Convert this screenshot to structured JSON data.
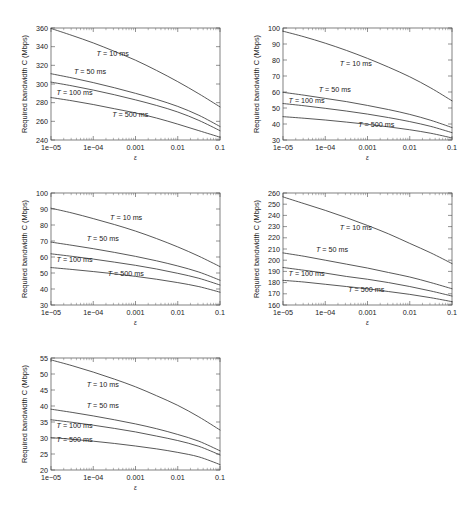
{
  "figure": {
    "background": "#ffffff",
    "axis_color": "#4a4a4a",
    "curve_color": "#3a3a3a",
    "panel_count": 5,
    "layout": "2 columns x 3 rows, last row single panel at left"
  },
  "common": {
    "xlabel": "ε",
    "ylabel": "Required bandwidth C (Mbps)",
    "xticklabels": [
      "1e−05",
      "1e−04",
      "0.001",
      "0.01",
      "0.1"
    ],
    "xticks": [
      1e-05,
      0.0001,
      0.001,
      0.01,
      0.1
    ],
    "xscale": "log",
    "xlim": [
      1e-05,
      0.1
    ],
    "series_names": [
      "T = 10 ms",
      "T = 50 ms",
      "T = 100 ms",
      "T = 500 ms"
    ]
  },
  "chart_data": [
    {
      "id": "panel-1",
      "position": "top-left",
      "type": "line",
      "title": "",
      "xlabel": "ε",
      "ylabel": "Required bandwidth C (Mbps)",
      "xscale": "log",
      "xlim": [
        1e-05,
        0.1
      ],
      "ylim": [
        240,
        360
      ],
      "yticks": [
        240,
        260,
        280,
        300,
        320,
        340,
        360
      ],
      "yticklabels": [
        "240",
        "260",
        "280",
        "300",
        "320",
        "340",
        "360"
      ],
      "xticklabels": [
        "1e−05",
        "1e−04",
        "0.001",
        "0.01",
        "0.1"
      ],
      "grid": false,
      "legend": "inline curve annotations",
      "x": [
        1e-05,
        3.16e-05,
        0.0001,
        0.000316,
        0.001,
        0.00316,
        0.01,
        0.0316,
        0.1
      ],
      "series": [
        {
          "name": "T = 10 ms",
          "label": "T = 10 ms",
          "values": [
            359.5,
            352.0,
            344.0,
            335.0,
            325.5,
            314.5,
            302.5,
            289.5,
            275.5
          ],
          "label_pos": {
            "x": 0.00012,
            "y": 330
          }
        },
        {
          "name": "T = 50 ms",
          "label": "T = 50 ms",
          "values": [
            311.0,
            306.5,
            301.5,
            296.0,
            290.0,
            283.5,
            276.0,
            266.5,
            254.5
          ],
          "label_pos": {
            "x": 3.5e-05,
            "y": 311
          }
        },
        {
          "name": "T = 100 ms",
          "label": "T = 100 ms",
          "values": [
            302.0,
            298.0,
            293.5,
            288.5,
            283.0,
            277.0,
            270.0,
            261.0,
            250.0
          ],
          "label_pos": {
            "x": 1.35e-05,
            "y": 288
          }
        },
        {
          "name": "T = 500 ms",
          "label": "T = 500 ms",
          "values": [
            285.5,
            282.0,
            278.0,
            273.5,
            269.0,
            263.5,
            257.0,
            250.0,
            243.0
          ],
          "label_pos": {
            "x": 0.00028,
            "y": 265
          }
        }
      ]
    },
    {
      "id": "panel-2",
      "position": "top-right",
      "type": "line",
      "title": "",
      "xlabel": "ε",
      "ylabel": "Required bandwidth C (Mbps)",
      "xscale": "log",
      "xlim": [
        1e-05,
        0.1
      ],
      "ylim": [
        30,
        100
      ],
      "yticks": [
        30,
        40,
        50,
        60,
        70,
        80,
        90,
        100
      ],
      "yticklabels": [
        "30",
        "40",
        "50",
        "60",
        "70",
        "80",
        "90",
        "100"
      ],
      "xticklabels": [
        "1e−05",
        "1e−04",
        "0.001",
        "0.01",
        "0.1"
      ],
      "grid": false,
      "legend": "inline curve annotations",
      "x": [
        1e-05,
        3.16e-05,
        0.0001,
        0.000316,
        0.001,
        0.00316,
        0.01,
        0.0316,
        0.1
      ],
      "series": [
        {
          "name": "T = 10 ms",
          "label": "T = 10 ms",
          "values": [
            98.0,
            94.5,
            90.5,
            86.0,
            81.0,
            75.5,
            69.5,
            62.5,
            54.5
          ],
          "label_pos": {
            "x": 0.00022,
            "y": 76
          }
        },
        {
          "name": "T = 50 ms",
          "label": "T = 50 ms",
          "values": [
            59.8,
            58.0,
            56.0,
            54.0,
            51.6,
            49.0,
            46.0,
            42.3,
            37.8
          ],
          "label_pos": {
            "x": 7e-05,
            "y": 60
          }
        },
        {
          "name": "T = 100 ms",
          "label": "T = 100 ms",
          "values": [
            52.8,
            51.4,
            49.8,
            48.1,
            46.2,
            44.0,
            41.5,
            38.5,
            34.6
          ],
          "label_pos": {
            "x": 1.35e-05,
            "y": 53
          }
        },
        {
          "name": "T = 500 ms",
          "label": "T = 500 ms",
          "values": [
            44.6,
            43.6,
            42.5,
            41.2,
            39.8,
            38.2,
            36.4,
            34.2,
            31.3
          ],
          "label_pos": {
            "x": 0.0006,
            "y": 38
          }
        }
      ]
    },
    {
      "id": "panel-3",
      "position": "middle-left",
      "type": "line",
      "title": "",
      "xlabel": "ε",
      "ylabel": "Required bandwidth C (Mbps)",
      "xscale": "log",
      "xlim": [
        1e-05,
        0.1
      ],
      "ylim": [
        30,
        100
      ],
      "yticks": [
        30,
        40,
        50,
        60,
        70,
        80,
        90,
        100
      ],
      "yticklabels": [
        "30",
        "40",
        "50",
        "60",
        "70",
        "80",
        "90",
        "100"
      ],
      "xticklabels": [
        "1e−05",
        "1e−04",
        "0.001",
        "0.01",
        "0.1"
      ],
      "grid": false,
      "legend": "inline curve annotations",
      "x": [
        1e-05,
        3.16e-05,
        0.0001,
        0.000316,
        0.001,
        0.00316,
        0.01,
        0.0316,
        0.1
      ],
      "series": [
        {
          "name": "T = 10 ms",
          "label": "T = 10 ms",
          "values": [
            90.5,
            87.5,
            84.0,
            80.3,
            76.2,
            71.5,
            66.3,
            60.5,
            54.0
          ],
          "label_pos": {
            "x": 0.00025,
            "y": 83
          }
        },
        {
          "name": "T = 50 ms",
          "label": "T = 50 ms",
          "values": [
            69.3,
            67.3,
            65.2,
            62.9,
            60.4,
            57.6,
            54.4,
            50.6,
            45.5
          ],
          "label_pos": {
            "x": 7e-05,
            "y": 70
          }
        },
        {
          "name": "T = 100 ms",
          "label": "T = 100 ms",
          "values": [
            62.0,
            60.4,
            58.7,
            56.8,
            54.8,
            52.5,
            49.8,
            46.7,
            42.5
          ],
          "label_pos": {
            "x": 1.35e-05,
            "y": 57
          }
        },
        {
          "name": "T = 500 ms",
          "label": "T = 500 ms",
          "values": [
            53.4,
            52.2,
            50.9,
            49.5,
            47.9,
            46.1,
            44.0,
            41.5,
            38.0
          ],
          "label_pos": {
            "x": 0.00022,
            "y": 48
          }
        }
      ]
    },
    {
      "id": "panel-4",
      "position": "middle-right",
      "type": "line",
      "title": "",
      "xlabel": "ε",
      "ylabel": "Required bandwidth C (Mbps)",
      "xscale": "log",
      "xlim": [
        1e-05,
        0.1
      ],
      "ylim": [
        160,
        260
      ],
      "yticks": [
        160,
        170,
        180,
        190,
        200,
        210,
        220,
        230,
        240,
        250,
        260
      ],
      "yticklabels": [
        "160",
        "170",
        "180",
        "190",
        "200",
        "210",
        "220",
        "230",
        "240",
        "250",
        "260"
      ],
      "xticklabels": [
        "1e−05",
        "1e−04",
        "0.001",
        "0.01",
        "0.1"
      ],
      "grid": false,
      "legend": "inline curve annotations",
      "x": [
        1e-05,
        3.16e-05,
        0.0001,
        0.000316,
        0.001,
        0.00316,
        0.01,
        0.0316,
        0.1
      ],
      "series": [
        {
          "name": "T = 10 ms",
          "label": "T = 10 ms",
          "values": [
            256.5,
            250.5,
            244.5,
            238.0,
            231.0,
            223.5,
            215.0,
            206.5,
            197.0
          ],
          "label_pos": {
            "x": 0.00022,
            "y": 227
          }
        },
        {
          "name": "T = 50 ms",
          "label": "T = 50 ms",
          "values": [
            206.5,
            203.5,
            200.0,
            196.5,
            193.0,
            189.0,
            185.0,
            180.0,
            174.5
          ],
          "label_pos": {
            "x": 6e-05,
            "y": 207
          }
        },
        {
          "name": "T = 100 ms",
          "label": "T = 100 ms",
          "values": [
            193.5,
            191.0,
            188.5,
            185.5,
            183.0,
            180.0,
            176.5,
            172.5,
            168.0
          ],
          "label_pos": {
            "x": 1.35e-05,
            "y": 186
          }
        },
        {
          "name": "T = 500 ms",
          "label": "T = 500 ms",
          "values": [
            182.0,
            180.5,
            178.5,
            176.5,
            174.5,
            172.0,
            169.5,
            166.5,
            163.0
          ],
          "label_pos": {
            "x": 0.00035,
            "y": 172
          }
        }
      ]
    },
    {
      "id": "panel-5",
      "position": "bottom-left",
      "type": "line",
      "title": "",
      "xlabel": "ε",
      "ylabel": "Required bandwidth C (Mbps)",
      "xscale": "log",
      "xlim": [
        1e-05,
        0.1
      ],
      "ylim": [
        20,
        55
      ],
      "yticks": [
        20,
        25,
        30,
        35,
        40,
        45,
        50,
        55
      ],
      "yticklabels": [
        "20",
        "25",
        "30",
        "35",
        "40",
        "45",
        "50",
        "55"
      ],
      "xticklabels": [
        "1e−05",
        "1e−04",
        "0.001",
        "0.01",
        "0.1"
      ],
      "grid": false,
      "legend": "inline curve annotations",
      "x": [
        1e-05,
        3.16e-05,
        0.0001,
        0.000316,
        0.001,
        0.00316,
        0.01,
        0.0316,
        0.1
      ],
      "series": [
        {
          "name": "T = 10 ms",
          "label": "T = 10 ms",
          "values": [
            54.4,
            52.6,
            50.6,
            48.4,
            46.0,
            43.2,
            40.2,
            36.6,
            32.5
          ],
          "label_pos": {
            "x": 7e-05,
            "y": 46
          }
        },
        {
          "name": "T = 50 ms",
          "label": "T = 50 ms",
          "values": [
            39.0,
            38.0,
            36.9,
            35.7,
            34.4,
            32.9,
            31.1,
            29.0,
            26.0
          ],
          "label_pos": {
            "x": 7e-05,
            "y": 39.5
          }
        },
        {
          "name": "T = 100 ms",
          "label": "T = 100 ms",
          "values": [
            35.7,
            34.9,
            34.0,
            33.0,
            31.9,
            30.6,
            29.2,
            27.4,
            24.7
          ],
          "label_pos": {
            "x": 1.35e-05,
            "y": 33.2
          }
        },
        {
          "name": "T = 500 ms",
          "label": "T = 500 ms",
          "values": [
            30.1,
            29.6,
            29.0,
            28.3,
            27.5,
            26.6,
            25.5,
            24.1,
            21.7
          ],
          "label_pos": {
            "x": 1.35e-05,
            "y": 28.8
          }
        }
      ]
    }
  ]
}
